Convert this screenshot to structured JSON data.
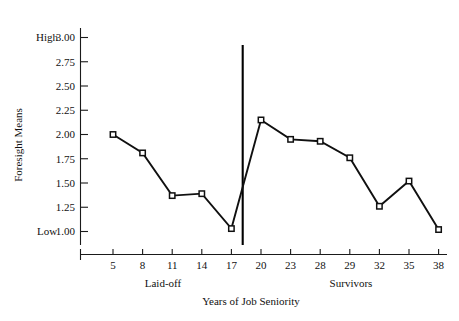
{
  "chart_data": {
    "type": "line",
    "title": "",
    "xlabel": "Years of Job Seniority",
    "ylabel": "Foresight Means",
    "categories": [
      "5",
      "8",
      "11",
      "14",
      "17",
      "20",
      "23",
      "28",
      "29",
      "32",
      "35",
      "38"
    ],
    "values": [
      2.0,
      1.81,
      1.37,
      1.39,
      1.03,
      2.15,
      1.95,
      1.93,
      1.76,
      1.26,
      1.52,
      1.02
    ],
    "ylim": [
      0.75,
      3.0
    ],
    "ytick_labels": [
      "3.00",
      "2.75",
      "2.50",
      "2.25",
      "2.00",
      "1.75",
      "1.50",
      "1.25",
      "1.00"
    ],
    "ytick_values": [
      3.0,
      2.75,
      2.5,
      2.25,
      2.0,
      1.75,
      1.5,
      1.25,
      1.0
    ],
    "y_anchor_high": "High",
    "y_anchor_low": "Low",
    "grid": false,
    "legend": "none",
    "marker": "square",
    "group_labels": [
      "Laid-off",
      "Survivors"
    ],
    "divider_after_category": "17",
    "annotations": []
  },
  "axes": {
    "y_axis_name": "Foresight Means",
    "x_axis_name": "Years of Job Seniority"
  }
}
